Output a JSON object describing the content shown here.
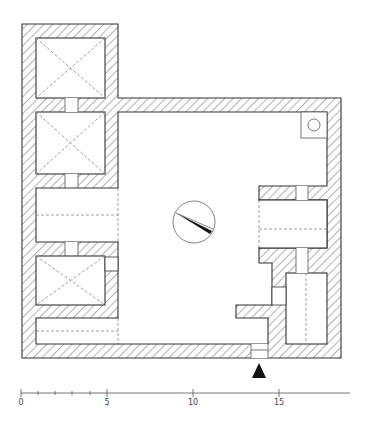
{
  "drawing": {
    "type": "architectural floor plan",
    "colors": {
      "line": "#333333",
      "hatch": "#555555",
      "dashed": "#888888",
      "background": "#ffffff"
    },
    "symbols": {
      "north_arrow": "compass-circle-with-needle",
      "entrance_marker": "black-triangle",
      "well": "small-circle-in-square"
    }
  },
  "scale_bar": {
    "ticks": [
      {
        "label": "0"
      },
      {
        "label": "5"
      },
      {
        "label": "10"
      },
      {
        "label": "15"
      }
    ]
  }
}
